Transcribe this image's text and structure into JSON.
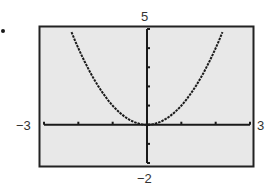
{
  "chart_data": {
    "type": "line",
    "title": "",
    "xlabel": "",
    "ylabel": "",
    "xlim": [
      -3,
      3
    ],
    "ylim": [
      -2,
      5
    ],
    "grid": false,
    "legend": null,
    "tick_labels": {
      "xmin": "−3",
      "xmax": "3",
      "ymin": "−2",
      "ymax": "5"
    },
    "x_ticks": [
      -3,
      -2,
      -1,
      0,
      1,
      2,
      3
    ],
    "y_ticks": [
      -2,
      -1,
      0,
      1,
      2,
      3,
      4,
      5
    ],
    "series": [
      {
        "name": "y = x^2",
        "x": [
          -2.2,
          -2.0,
          -1.5,
          -1.0,
          -0.5,
          -0.25,
          0,
          0.25,
          0.5,
          1.0,
          1.5,
          2.0,
          2.2
        ],
        "y": [
          4.84,
          4.0,
          2.25,
          1.0,
          0.25,
          0.06,
          0,
          0.06,
          0.25,
          1.0,
          2.25,
          4.0,
          4.84
        ]
      }
    ],
    "style": {
      "plot_background": "#e8e8e8",
      "frame_color": "#222222",
      "curve_color": "#1a1a1a"
    }
  }
}
